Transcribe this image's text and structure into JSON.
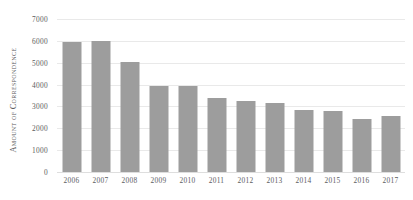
{
  "chart_data": {
    "type": "bar",
    "title": "",
    "subtitle": "",
    "xlabel": "",
    "ylabel": "Amount of Correspondence",
    "categories": [
      "2006",
      "2007",
      "2008",
      "2009",
      "2010",
      "2011",
      "2012",
      "2013",
      "2014",
      "2015",
      "2016",
      "2017"
    ],
    "values": [
      5950,
      5990,
      5030,
      3930,
      3930,
      3390,
      3250,
      3160,
      2840,
      2790,
      2430,
      2560
    ],
    "series": [
      {
        "name": "Amount of Correspondence",
        "values": [
          5950,
          5990,
          5030,
          3930,
          3930,
          3390,
          3250,
          3160,
          2840,
          2790,
          2430,
          2560
        ]
      }
    ],
    "ylim": [
      0,
      7000
    ],
    "ytick_values": [
      0,
      1000,
      2000,
      3000,
      4000,
      5000,
      6000,
      7000
    ],
    "ytick_labels": [
      "0",
      "1000",
      "2000",
      "3000",
      "4000",
      "5000",
      "6000",
      "7000"
    ],
    "grid": "horizontal",
    "legend": "none",
    "bar_color": "#9d9d9d",
    "gridline_color": "#e9e9e9",
    "background_color": "#ffffff",
    "text_color": "#5c5c5e"
  }
}
